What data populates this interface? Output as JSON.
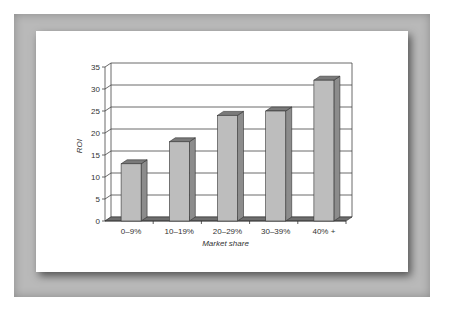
{
  "chart_data": {
    "type": "bar",
    "title": "",
    "xlabel": "Market share",
    "ylabel": "ROI",
    "categories": [
      "0–9%",
      "10–19%",
      "20–29%",
      "30–39%",
      "40% +"
    ],
    "values": [
      13,
      18,
      24,
      25,
      32
    ],
    "ylim": [
      0,
      35
    ],
    "yticks": [
      "0",
      "5",
      "10",
      "15",
      "20",
      "25",
      "30",
      "35"
    ],
    "grid": true,
    "legend": "none",
    "style": "3d-column",
    "colors": {
      "bar_front": "#bdbdbd",
      "bar_side": "#8c8c8c",
      "bar_top": "#7a7a7a",
      "floor": "#6e6e6e"
    }
  }
}
